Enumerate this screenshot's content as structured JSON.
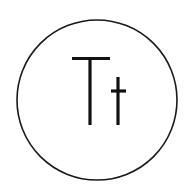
{
  "icon": {
    "name": "text-format-icon",
    "glyphs": "Tt",
    "stroke_color": "#111111",
    "background_color": "#ffffff"
  }
}
